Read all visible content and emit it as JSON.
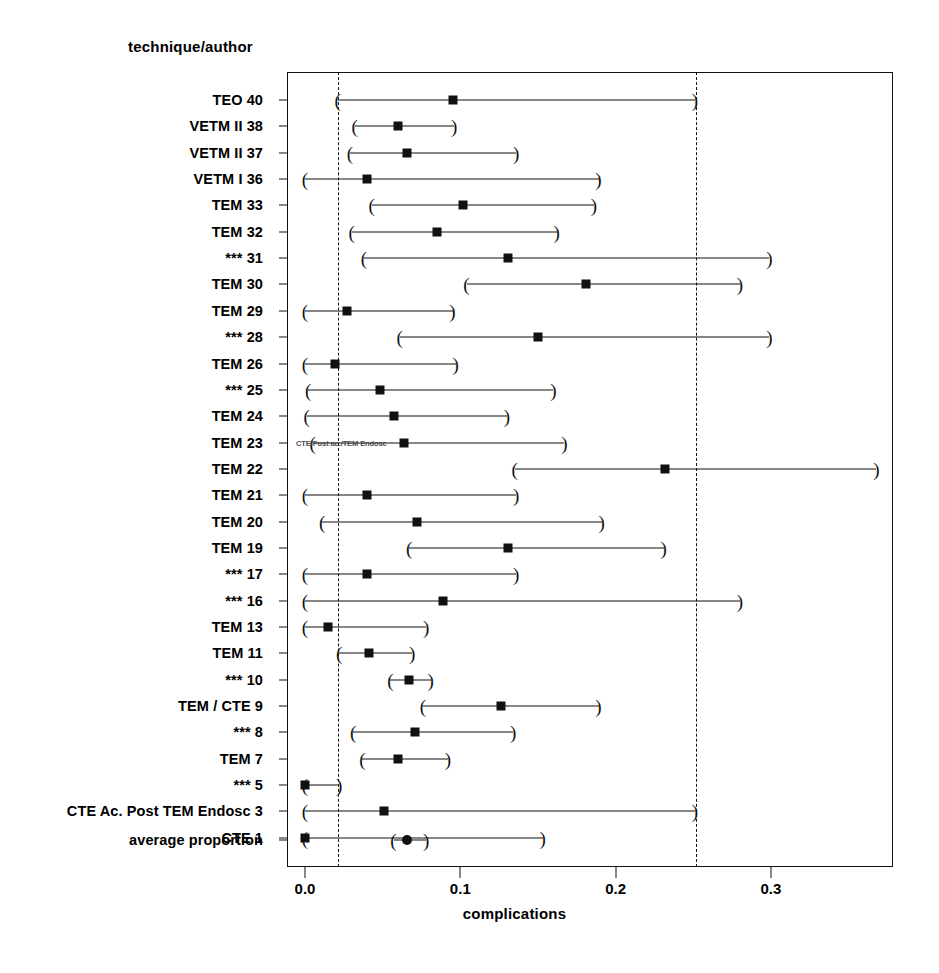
{
  "axis_titles": {
    "y_header": "technique/author",
    "x_label": "complications"
  },
  "artifact": {
    "text": "CTE/Post ac./TEM Endosc",
    "row_index": 13
  },
  "x_ticks": [
    {
      "label": "0.0",
      "value": 0.0
    },
    {
      "label": "0.1",
      "value": 0.1
    },
    {
      "label": "0.2",
      "value": 0.2
    },
    {
      "label": "0.3",
      "value": 0.3
    }
  ],
  "reference_lines": [
    {
      "name": "lower-reference-line",
      "value": 0.0215
    },
    {
      "name": "upper-reference-line",
      "value": 0.2515
    }
  ],
  "chart_data": {
    "type": "scatter",
    "title": "",
    "subtitle": "",
    "xlabel": "complications",
    "ylabel": "technique/author",
    "xlim": [
      -0.012,
      0.379
    ],
    "grid": false,
    "legend": "none",
    "orientation": "horizontal-forest-plot",
    "reference_lines": [
      0.0215,
      0.2515
    ],
    "marker_style": "filled square (studies), filled circle (summary)",
    "categories": [
      "TEO 40",
      "VETM II 38",
      "VETM II 37",
      "VETM I 36",
      "TEM 33",
      "TEM 32",
      "*** 31",
      "TEM 30",
      "TEM 29",
      "*** 28",
      "TEM 26",
      "*** 25",
      "TEM 24",
      "TEM 23",
      "TEM 22",
      "TEM 21",
      "TEM 20",
      "TEM 19",
      "*** 17",
      "*** 16",
      "TEM 13",
      "TEM 11",
      "*** 10",
      "TEM / CTE 9",
      "*** 8",
      "TEM 7",
      "*** 5",
      "CTE Ac. Post TEM Endosc 3",
      "CTE 1",
      "average proportion"
    ],
    "points": [
      {
        "label": "TEO 40",
        "estimate": 0.095,
        "ci_low": 0.021,
        "ci_high": 0.251,
        "marker": "square"
      },
      {
        "label": "VETM II 38",
        "estimate": 0.06,
        "ci_low": 0.032,
        "ci_high": 0.096,
        "marker": "square"
      },
      {
        "label": "VETM II 37",
        "estimate": 0.066,
        "ci_low": 0.029,
        "ci_high": 0.136,
        "marker": "square"
      },
      {
        "label": "VETM I 36",
        "estimate": 0.04,
        "ci_low": 0.0,
        "ci_high": 0.189,
        "marker": "square"
      },
      {
        "label": "TEM 33",
        "estimate": 0.102,
        "ci_low": 0.043,
        "ci_high": 0.186,
        "marker": "square"
      },
      {
        "label": "TEM 32",
        "estimate": 0.085,
        "ci_low": 0.03,
        "ci_high": 0.162,
        "marker": "square"
      },
      {
        "label": "*** 31",
        "estimate": 0.131,
        "ci_low": 0.038,
        "ci_high": 0.299,
        "marker": "square"
      },
      {
        "label": "TEM 30",
        "estimate": 0.181,
        "ci_low": 0.104,
        "ci_high": 0.28,
        "marker": "square"
      },
      {
        "label": "TEM 29",
        "estimate": 0.027,
        "ci_low": 0.0,
        "ci_high": 0.095,
        "marker": "square"
      },
      {
        "label": "*** 28",
        "estimate": 0.15,
        "ci_low": 0.061,
        "ci_high": 0.299,
        "marker": "square"
      },
      {
        "label": "TEM 26",
        "estimate": 0.019,
        "ci_low": 0.0,
        "ci_high": 0.097,
        "marker": "square"
      },
      {
        "label": "*** 25",
        "estimate": 0.048,
        "ci_low": 0.002,
        "ci_high": 0.16,
        "marker": "square"
      },
      {
        "label": "TEM 24",
        "estimate": 0.057,
        "ci_low": 0.001,
        "ci_high": 0.13,
        "marker": "square"
      },
      {
        "label": "TEM 23",
        "estimate": 0.064,
        "ci_low": 0.005,
        "ci_high": 0.167,
        "marker": "square"
      },
      {
        "label": "TEM 22",
        "estimate": 0.232,
        "ci_low": 0.135,
        "ci_high": 0.368,
        "marker": "square"
      },
      {
        "label": "TEM 21",
        "estimate": 0.04,
        "ci_low": 0.0,
        "ci_high": 0.136,
        "marker": "square"
      },
      {
        "label": "TEM 20",
        "estimate": 0.072,
        "ci_low": 0.011,
        "ci_high": 0.191,
        "marker": "square"
      },
      {
        "label": "TEM 19",
        "estimate": 0.131,
        "ci_low": 0.067,
        "ci_high": 0.231,
        "marker": "square"
      },
      {
        "label": "*** 17",
        "estimate": 0.04,
        "ci_low": 0.0,
        "ci_high": 0.136,
        "marker": "square"
      },
      {
        "label": "*** 16",
        "estimate": 0.089,
        "ci_low": 0.0,
        "ci_high": 0.28,
        "marker": "square"
      },
      {
        "label": "TEM 13",
        "estimate": 0.015,
        "ci_low": 0.0,
        "ci_high": 0.078,
        "marker": "square"
      },
      {
        "label": "TEM 11",
        "estimate": 0.041,
        "ci_low": 0.022,
        "ci_high": 0.069,
        "marker": "square"
      },
      {
        "label": "*** 10",
        "estimate": 0.067,
        "ci_low": 0.055,
        "ci_high": 0.081,
        "marker": "square"
      },
      {
        "label": "TEM / CTE 9",
        "estimate": 0.126,
        "ci_low": 0.076,
        "ci_high": 0.189,
        "marker": "square"
      },
      {
        "label": "*** 8",
        "estimate": 0.071,
        "ci_low": 0.031,
        "ci_high": 0.134,
        "marker": "square"
      },
      {
        "label": "TEM 7",
        "estimate": 0.06,
        "ci_low": 0.037,
        "ci_high": 0.092,
        "marker": "square"
      },
      {
        "label": "*** 5",
        "estimate": 0.0,
        "ci_low": 0.0,
        "ci_high": 0.022,
        "marker": "square"
      },
      {
        "label": "CTE Ac. Post TEM Endosc 3",
        "estimate": 0.051,
        "ci_low": 0.0,
        "ci_high": 0.251,
        "marker": "square"
      },
      {
        "label": "CTE 1",
        "estimate": 0.0,
        "ci_low": 0.0,
        "ci_high": 0.153,
        "marker": "square"
      },
      {
        "label": "average proportion",
        "estimate": 0.066,
        "ci_low": 0.057,
        "ci_high": 0.078,
        "marker": "circle"
      }
    ]
  }
}
